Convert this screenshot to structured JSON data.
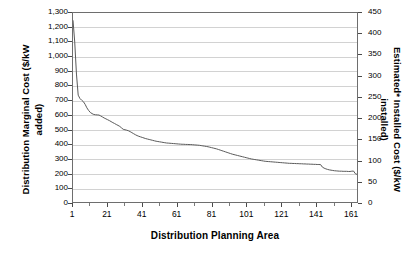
{
  "chart_data": {
    "type": "line",
    "title": "",
    "xlabel": "Distribution Planning Area",
    "ylabel": "Distribution Marginal Cost ($/kW added)",
    "ylabel_secondary": "Estimated* Installed Cost ($/kW installed)",
    "xlim": [
      1,
      165
    ],
    "ylim": [
      0,
      1300
    ],
    "ylim_secondary": [
      0,
      450
    ],
    "grid": true,
    "legend": null,
    "series": [
      {
        "name": "Distribution Marginal Cost",
        "axis": "left",
        "x": [
          1,
          2,
          3,
          4,
          5,
          6,
          7,
          8,
          9,
          10,
          11,
          12,
          13,
          14,
          15,
          16,
          17,
          18,
          19,
          20,
          21,
          22,
          23,
          24,
          25,
          26,
          27,
          28,
          29,
          30,
          31,
          32,
          33,
          34,
          35,
          36,
          37,
          38,
          39,
          40,
          41,
          42,
          43,
          44,
          45,
          46,
          47,
          48,
          49,
          50,
          51,
          52,
          53,
          54,
          55,
          56,
          57,
          58,
          59,
          60,
          61,
          62,
          63,
          64,
          65,
          66,
          67,
          68,
          69,
          70,
          71,
          72,
          73,
          74,
          75,
          76,
          77,
          78,
          79,
          80,
          81,
          82,
          83,
          84,
          85,
          86,
          87,
          88,
          89,
          90,
          91,
          92,
          93,
          94,
          95,
          96,
          97,
          98,
          99,
          100,
          101,
          102,
          103,
          104,
          105,
          106,
          107,
          108,
          109,
          110,
          111,
          112,
          113,
          114,
          115,
          116,
          117,
          118,
          119,
          120,
          121,
          122,
          123,
          124,
          125,
          126,
          127,
          128,
          129,
          130,
          131,
          132,
          133,
          134,
          135,
          136,
          137,
          138,
          139,
          140,
          141,
          142,
          143,
          144,
          145,
          146,
          147,
          148,
          149,
          150,
          151,
          152,
          153,
          154,
          155,
          156,
          157,
          158,
          159,
          160,
          161,
          162,
          163,
          164,
          165
        ],
        "values": [
          1250,
          1100,
          880,
          735,
          712,
          700,
          690,
          672,
          648,
          630,
          616,
          608,
          602,
          600,
          599,
          598,
          592,
          585,
          578,
          572,
          566,
          560,
          553,
          546,
          540,
          533,
          527,
          520,
          510,
          500,
          497,
          494,
          490,
          484,
          477,
          470,
          463,
          457,
          452,
          448,
          444,
          440,
          436,
          433,
          430,
          427,
          424,
          421,
          418,
          416,
          414,
          412,
          410,
          408,
          406,
          405,
          404,
          403,
          402,
          401,
          400,
          399,
          398,
          397,
          397,
          396,
          396,
          395,
          395,
          394,
          393,
          392,
          391,
          390,
          388,
          386,
          384,
          382,
          380,
          377,
          374,
          371,
          368,
          365,
          361,
          357,
          353,
          349,
          345,
          341,
          337,
          333,
          329,
          326,
          323,
          320,
          317,
          314,
          311,
          308,
          305,
          302,
          299,
          296,
          294,
          292,
          290,
          288,
          286,
          284,
          282,
          280,
          279,
          278,
          277,
          276,
          275,
          274,
          273,
          272,
          271,
          270,
          269,
          268,
          267,
          266,
          266,
          265,
          265,
          264,
          264,
          263,
          263,
          262,
          262,
          261,
          261,
          260,
          260,
          259,
          259,
          258,
          258,
          257,
          240,
          233,
          228,
          224,
          221,
          219,
          217,
          215,
          214,
          213,
          212,
          212,
          211,
          211,
          211,
          210,
          210,
          212,
          213,
          195,
          190
        ]
      }
    ],
    "y_ticks_left": [
      "0",
      "100",
      "200",
      "300",
      "400",
      "500",
      "600",
      "700",
      "800",
      "900",
      "1,000",
      "1,100",
      "1,200",
      "1,300"
    ],
    "y_ticks_right": [
      "0",
      "50",
      "100",
      "150",
      "200",
      "250",
      "300",
      "350",
      "400",
      "450"
    ],
    "x_ticks": [
      "1",
      "21",
      "41",
      "61",
      "81",
      "101",
      "121",
      "141",
      "161"
    ],
    "x_tick_values": [
      1,
      21,
      41,
      61,
      81,
      101,
      121,
      141,
      161
    ],
    "x_minor_step": 10,
    "series_color": "#5a5a5a",
    "grid_color": "#d2d2d2",
    "axis_color": "#6e6e6e"
  }
}
